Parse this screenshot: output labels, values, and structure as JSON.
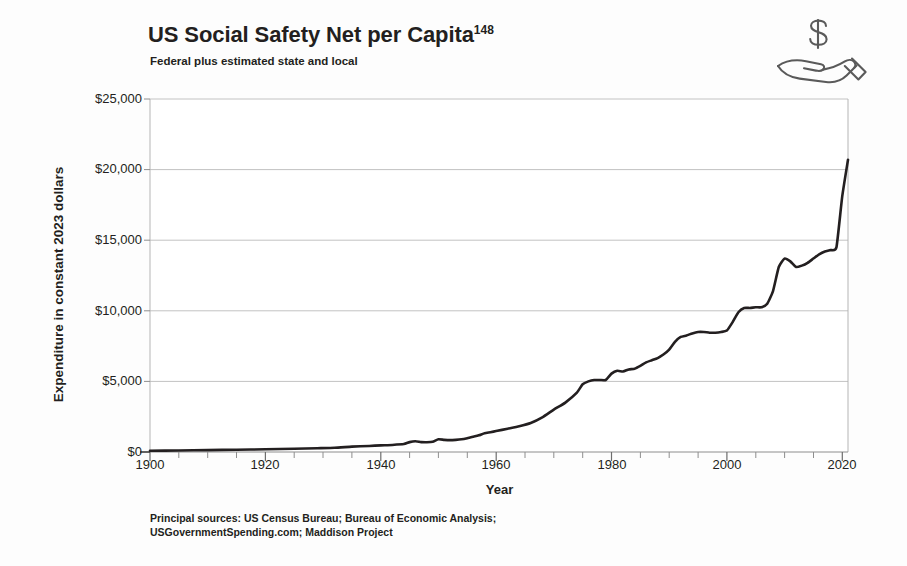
{
  "header": {
    "title": "US Social Safety Net per Capita",
    "title_superscript": "148",
    "subtitle": "Federal plus estimated state and local",
    "icon": "hand-holding-dollar-icon"
  },
  "source_note": {
    "line1": "Principal sources: US Census Bureau; Bureau of Economic Analysis;",
    "line2": "USGovernmentSpending.com; Maddison Project"
  },
  "colors": {
    "background": "#fdfdfd",
    "line": "#231f20",
    "gridline": "#bfbfbf",
    "axis": "#8a8a8a",
    "text": "#231f20"
  },
  "chart_data": {
    "type": "line",
    "title": "US Social Safety Net per Capita",
    "subtitle": "Federal plus estimated state and local",
    "xlabel": "Year",
    "ylabel": "Expenditure in constant 2023 dollars",
    "xlim": [
      1900,
      2021
    ],
    "ylim": [
      0,
      25000
    ],
    "grid": true,
    "legend": "none",
    "x_ticks": [
      1900,
      1920,
      1940,
      1960,
      1980,
      2000,
      2020
    ],
    "x_tick_labels": [
      "1900",
      "1920",
      "1940",
      "1960",
      "1980",
      "2000",
      "2020"
    ],
    "x_minor_tick_step": 5,
    "y_ticks": [
      0,
      5000,
      10000,
      15000,
      20000,
      25000
    ],
    "y_tick_labels": [
      "$0",
      "$5,000",
      "$10,000",
      "$15,000",
      "$20,000",
      "$25,000"
    ],
    "series": [
      {
        "name": "US Social Safety Net per Capita",
        "x": [
          1900,
          1905,
          1910,
          1915,
          1920,
          1925,
          1929,
          1932,
          1935,
          1938,
          1940,
          1942,
          1944,
          1945,
          1946,
          1947,
          1948,
          1949,
          1950,
          1951,
          1952,
          1953,
          1954,
          1955,
          1956,
          1957,
          1958,
          1959,
          1960,
          1962,
          1964,
          1966,
          1968,
          1970,
          1972,
          1974,
          1975,
          1976,
          1977,
          1978,
          1979,
          1980,
          1981,
          1982,
          1983,
          1984,
          1985,
          1986,
          1987,
          1988,
          1989,
          1990,
          1991,
          1992,
          1993,
          1994,
          1995,
          1996,
          1997,
          1998,
          1999,
          2000,
          2001,
          2002,
          2003,
          2004,
          2005,
          2006,
          2007,
          2008,
          2009,
          2010,
          2011,
          2012,
          2013,
          2014,
          2015,
          2016,
          2017,
          2018,
          2019,
          2020,
          2021
        ],
        "y": [
          90,
          110,
          135,
          160,
          190,
          230,
          270,
          300,
          380,
          430,
          470,
          500,
          560,
          700,
          760,
          700,
          690,
          720,
          900,
          860,
          840,
          860,
          900,
          980,
          1080,
          1180,
          1330,
          1400,
          1480,
          1650,
          1820,
          2050,
          2450,
          3000,
          3500,
          4200,
          4800,
          5000,
          5100,
          5100,
          5100,
          5550,
          5750,
          5700,
          5850,
          5900,
          6100,
          6350,
          6500,
          6650,
          6900,
          7250,
          7800,
          8150,
          8250,
          8400,
          8500,
          8500,
          8450,
          8450,
          8500,
          8600,
          9200,
          9900,
          10200,
          10200,
          10250,
          10250,
          10500,
          11400,
          13100,
          13700,
          13500,
          13100,
          13200,
          13400,
          13700,
          14000,
          14200,
          14300,
          14500,
          18100,
          20700
        ],
        "units": "constant 2023 dollars per capita",
        "line_width": 2.6,
        "color": "#231f20",
        "markers": false
      }
    ],
    "annotations": [
      {
        "label": "flat near zero",
        "x_range": [
          1900,
          1935
        ]
      },
      {
        "label": "WWII bump and postwar dip",
        "x_range": [
          1944,
          1949
        ]
      },
      {
        "label": "Great Society growth",
        "x_range": [
          1964,
          1976
        ]
      },
      {
        "label": "Great Recession surge",
        "x_range": [
          2008,
          2010
        ]
      },
      {
        "label": "COVID-19 spike",
        "x_range": [
          2019,
          2021
        ]
      }
    ]
  }
}
